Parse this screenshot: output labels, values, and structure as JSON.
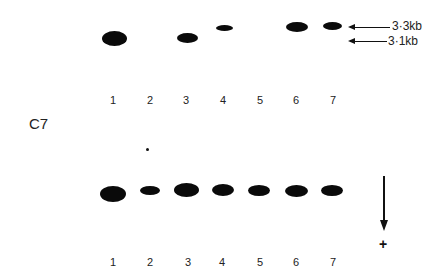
{
  "figure": {
    "panel_label": "C7",
    "top_gel": {
      "lane_labels": [
        "1",
        "2",
        "3",
        "4",
        "5",
        "6",
        "7"
      ],
      "markers": [
        {
          "label": "3·3kb"
        },
        {
          "label": "3·1kb"
        }
      ],
      "bands": [
        {
          "lane": "1",
          "present": true
        },
        {
          "lane": "2",
          "present": false
        },
        {
          "lane": "3",
          "present": true
        },
        {
          "lane": "4",
          "present": true
        },
        {
          "lane": "5",
          "present": false
        },
        {
          "lane": "6",
          "present": true
        },
        {
          "lane": "7",
          "present": true
        }
      ]
    },
    "bottom_gel": {
      "lane_labels": [
        "1",
        "2",
        "3",
        "4",
        "5",
        "6",
        "7"
      ],
      "direction_symbol": "+"
    }
  }
}
